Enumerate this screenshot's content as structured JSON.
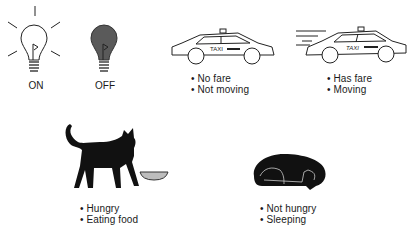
{
  "bulbs": [
    {
      "state": "on",
      "label": "ON",
      "icon": "lightbulb-on-icon"
    },
    {
      "state": "off",
      "label": "OFF",
      "icon": "lightbulb-off-icon"
    }
  ],
  "taxis": [
    {
      "icon": "taxi-parked-icon",
      "sign": "TAXI",
      "bullets": [
        "No fare",
        "Not moving"
      ]
    },
    {
      "icon": "taxi-moving-icon",
      "sign": "TAXI",
      "bullets": [
        "Has fare",
        "Moving"
      ]
    }
  ],
  "cats": [
    {
      "icon": "cat-eating-icon",
      "bullets": [
        "Hungry",
        "Eating food"
      ]
    },
    {
      "icon": "cat-sleeping-icon",
      "bullets": [
        "Not hungry",
        "Sleeping"
      ]
    }
  ],
  "colors": {
    "ink": "#1a1a1a",
    "off_bulb": "#5a5a5a",
    "bowl": "#bdbdbd"
  }
}
